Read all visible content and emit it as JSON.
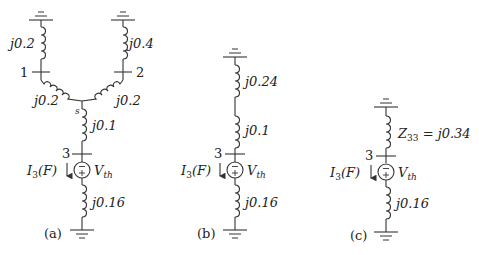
{
  "figure": {
    "panel_a": {
      "caption": "(a)",
      "bus1_label": "1",
      "bus2_label": "2",
      "bus3_label": "3",
      "node_s_label": "s",
      "left_gen_reactance": "j0.2",
      "right_gen_reactance": "j0.4",
      "left_line_reactance": "j0.2",
      "right_line_reactance": "j0.2",
      "s_to_bus3_reactance": "j0.1",
      "fault_reactance": "j0.16",
      "current_label": "I",
      "current_sub": "3",
      "current_arg": "(F)",
      "source_label": "V",
      "source_sub": "th"
    },
    "panel_b": {
      "caption": "(b)",
      "bus3_label": "3",
      "top_reactance": "j0.24",
      "mid_reactance": "j0.1",
      "fault_reactance": "j0.16",
      "current_label": "I",
      "current_sub": "3",
      "current_arg": "(F)",
      "source_label": "V",
      "source_sub": "th"
    },
    "panel_c": {
      "caption": "(c)",
      "bus3_label": "3",
      "thevenin_label": "Z",
      "thevenin_sub": "33",
      "thevenin_value": " = j0.34",
      "fault_reactance": "j0.16",
      "current_label": "I",
      "current_sub": "3",
      "current_arg": "(F)",
      "source_label": "V",
      "source_sub": "th"
    }
  }
}
